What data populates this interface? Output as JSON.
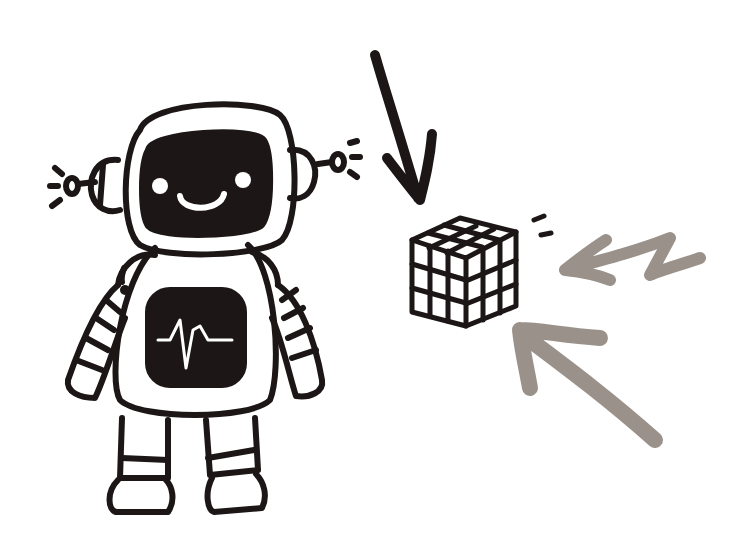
{
  "scene": {
    "description": "Cartoon robot illustration with a Rubik's cube and three arrows pointing at the cube",
    "colors": {
      "background": "#ffffff",
      "ink": "#1c1716",
      "arrow_dark": "#1c1716",
      "arrow_gray": "#9a928a"
    },
    "elements": [
      {
        "name": "robot",
        "icon": "robot-icon"
      },
      {
        "name": "heartbeat-screen",
        "icon": "heartbeat-icon"
      },
      {
        "name": "rubiks-cube",
        "icon": "cube-icon"
      },
      {
        "name": "arrow-black-down",
        "icon": "arrow-down-icon"
      },
      {
        "name": "arrow-gray-left",
        "icon": "arrow-left-icon"
      },
      {
        "name": "arrow-gray-up-left",
        "icon": "arrow-up-left-icon"
      }
    ]
  }
}
